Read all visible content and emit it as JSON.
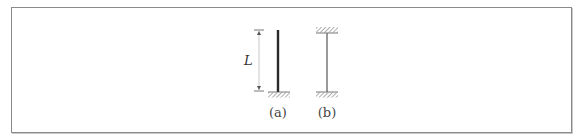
{
  "figure": {
    "dimension_label": "L",
    "columns": [
      {
        "id": "a",
        "caption": "(a)",
        "support": "fixed-base, free top (cantilever)"
      },
      {
        "id": "b",
        "caption": "(b)",
        "support": "fixed at both ends"
      }
    ]
  },
  "colors": {
    "frame": "#8a8a8a",
    "column_a": "#2a2a2a",
    "column_b": "#6e6e6e",
    "hatch": "#777777",
    "dimension": "#555555"
  }
}
